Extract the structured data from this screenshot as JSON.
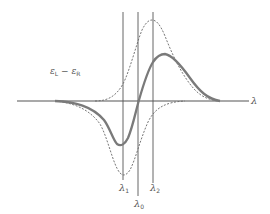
{
  "figure": {
    "ylabel": "ε",
    "ylabel_sub_left": "L",
    "ylabel_minus": " − ε",
    "ylabel_sub_right": "R",
    "xlabel": "λ",
    "markers": [
      {
        "symbol": "λ",
        "sub": "1"
      },
      {
        "symbol": "λ",
        "sub": "0"
      },
      {
        "symbol": "λ",
        "sub": "2"
      }
    ],
    "curves": [
      {
        "name": "dispersive-cd-curve",
        "style": "solid-thick"
      },
      {
        "name": "positive-absorption-band",
        "style": "dashed"
      },
      {
        "name": "negative-absorption-band",
        "style": "dashed"
      }
    ],
    "colors": {
      "line": "#555555",
      "thick": "#7a7a7a"
    }
  }
}
